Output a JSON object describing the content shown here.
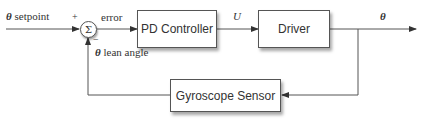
{
  "diagram": {
    "type": "feedback control loop block diagram",
    "blocks": {
      "controller": "PD Controller",
      "driver": "Driver",
      "sensor": "Gyroscope Sensor"
    },
    "summing_junction": {
      "symbol": "Σ",
      "plus_sign": "+",
      "minus_sign": "−"
    },
    "signals": {
      "input_symbol": "θ",
      "input_text": " setpoint",
      "error": "error",
      "control": "U",
      "output": "θ",
      "feedback_symbol": "θ",
      "feedback_text": " lean angle"
    },
    "colors": {
      "line": "#555555",
      "text": "#333333",
      "box_fill": "#ffffff"
    }
  }
}
